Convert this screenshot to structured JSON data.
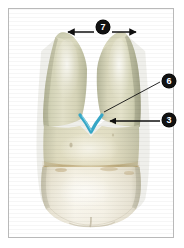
{
  "figure": {
    "type": "anatomical-photograph",
    "background_color": "#ffffff",
    "frame_color": "#b9b9b9",
    "callouts": [
      {
        "id": "7",
        "label": "7",
        "name": "inter-root-distance",
        "marker": "double-headed-arrow",
        "position": "top-center",
        "description": "horizontal double-headed dimension arrow spanning between the two root apices"
      },
      {
        "id": "6",
        "label": "6",
        "name": "furcation-entrance",
        "marker": "leader-line",
        "position": "upper-right",
        "description": "diagonal leader line running down-left to the apex of the furcation notch"
      },
      {
        "id": "3",
        "label": "3",
        "name": "root-trunk-marking",
        "marker": "horizontal-arrow",
        "position": "right",
        "description": "horizontal arrow pointing left to the cyan V marking at the root furcation"
      }
    ],
    "markings": {
      "furcation_highlight_color": "#36a6c6",
      "furcation_highlight_shape": "V",
      "arrow_color": "#101010",
      "callout_fill": "#111111",
      "callout_text_color": "#ffffff"
    },
    "specimen_colors": {
      "root_upper": "#cfd0b2",
      "root_mid": "#d9d7bc",
      "root_lower": "#ded9c0",
      "cervical_stain": "#b79a63",
      "crown_enamel": "#f3efe4",
      "crown_highlight": "#fbfaf4",
      "shadow_edge": "#a9a58c"
    }
  }
}
